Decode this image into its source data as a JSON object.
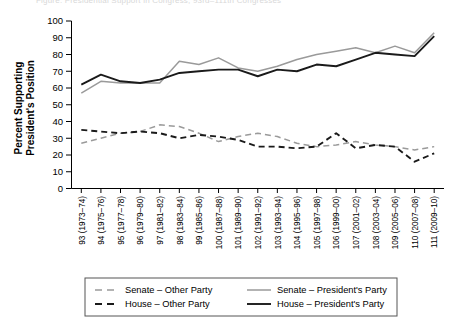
{
  "figure": {
    "cut_off_header": "Figure: Presidential Support in Congress, 93rd–111th Congresses",
    "ylabel_line1": "Percent Supporting",
    "ylabel_line2": "President's Position"
  },
  "chart_data": {
    "type": "line",
    "title": "",
    "xlabel": "",
    "ylabel": "Percent Supporting President's Position",
    "ylim": [
      0,
      100
    ],
    "yticks": [
      0,
      10,
      20,
      30,
      40,
      50,
      60,
      70,
      80,
      90,
      100
    ],
    "grid": false,
    "legend_position": "bottom",
    "categories": [
      "93 (1973–74)",
      "94 (1975–76)",
      "95 (1977–78)",
      "96 (1979–80)",
      "97 (1981–82)",
      "98 (1983–84)",
      "99 (1985–86)",
      "100 (1987–88)",
      "101 (1989–90)",
      "102 (1991–92)",
      "103 (1993–94)",
      "104 (1995–96)",
      "105 (1997–98)",
      "106 (1999–00)",
      "107 (2001–02)",
      "108 (2003–04)",
      "109 (2005–06)",
      "110 (2007–08)",
      "111 (2009–10)"
    ],
    "series": [
      {
        "name": "Senate – Other Party",
        "key": "senate_other",
        "color": "#9a9a9a",
        "dash": "6,4",
        "width": 1.5,
        "values": [
          27,
          30,
          33,
          34,
          38,
          37,
          33,
          28,
          31,
          33,
          31,
          27,
          25,
          26,
          28,
          26,
          25,
          23,
          25
        ]
      },
      {
        "name": "House – Other Party",
        "key": "house_other",
        "color": "#1a1a1a",
        "dash": "6,4",
        "width": 1.9,
        "values": [
          35,
          34,
          33,
          34,
          33,
          30,
          32,
          31,
          29,
          25,
          25,
          24,
          25,
          33,
          24,
          26,
          25,
          16,
          21
        ]
      },
      {
        "name": "Senate – President's  Party",
        "key": "senate_president",
        "color": "#9a9a9a",
        "dash": "",
        "width": 1.5,
        "values": [
          57,
          64,
          63,
          63,
          63,
          76,
          74,
          78,
          72,
          70,
          73,
          77,
          80,
          82,
          84,
          81,
          85,
          81,
          93
        ]
      },
      {
        "name": "House – President's  Party",
        "key": "house_president",
        "color": "#1a1a1a",
        "dash": "",
        "width": 1.9,
        "values": [
          62,
          68,
          64,
          63,
          65,
          69,
          70,
          71,
          71,
          67,
          71,
          70,
          74,
          73,
          77,
          81,
          80,
          79,
          91
        ]
      }
    ]
  },
  "legend": {
    "items": [
      {
        "label": "Senate – Other Party",
        "series": "senate_other"
      },
      {
        "label": "Senate – President's  Party",
        "series": "senate_president"
      },
      {
        "label": "House – Other Party",
        "series": "house_other"
      },
      {
        "label": "House – President's  Party",
        "series": "house_president"
      }
    ]
  }
}
